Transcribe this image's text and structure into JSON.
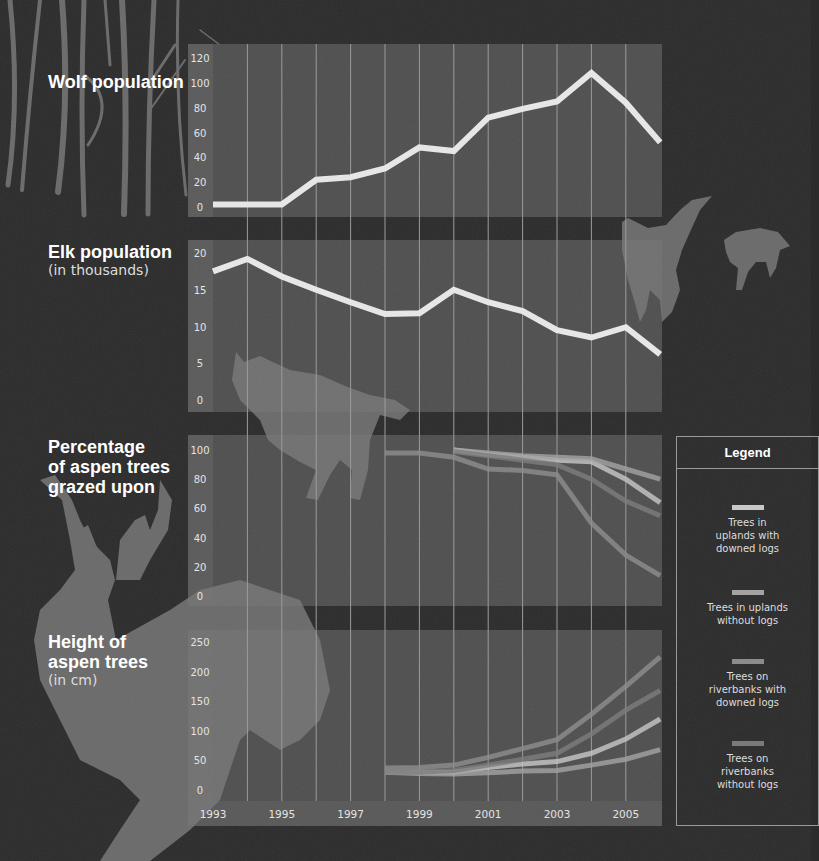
{
  "titles": {
    "wolf": "Wolf population",
    "elk": "Elk population",
    "elk_sub": "(in thousands)",
    "grazed_line1": "Percentage",
    "grazed_line2": "of aspen trees",
    "grazed_line3": "grazed upon",
    "height_line1": "Height of",
    "height_line2": "aspen trees",
    "height_sub": "(in cm)"
  },
  "legend": {
    "title": "Legend",
    "items": [
      {
        "label": "Trees in uplands with downed logs",
        "color": "#c8c8c8"
      },
      {
        "label": "Trees in uplands without logs",
        "color": "#a3a3a3"
      },
      {
        "label": "Trees on riverbanks with downed logs",
        "color": "#8c8c8c"
      },
      {
        "label": "Trees on riverbanks without logs",
        "color": "#7a7a7a"
      }
    ]
  },
  "x_ticks": [
    "1993",
    "1995",
    "1997",
    "1999",
    "2001",
    "2003",
    "2005"
  ],
  "chart_data": [
    {
      "type": "line",
      "title": "Wolf population",
      "x": [
        1993,
        1994,
        1995,
        1996,
        1997,
        1998,
        1999,
        2000,
        2001,
        2002,
        2003,
        2004,
        2005,
        2006
      ],
      "series": [
        {
          "name": "Wolves",
          "values": [
            2,
            2,
            2,
            22,
            24,
            31,
            48,
            45,
            72,
            79,
            85,
            108,
            84,
            52
          ]
        }
      ],
      "yticks": [
        0,
        20,
        40,
        60,
        80,
        100,
        120
      ],
      "ylim": [
        0,
        125
      ],
      "grid": "vertical"
    },
    {
      "type": "line",
      "title": "Elk population",
      "ylabel": "(in thousands)",
      "x": [
        1993,
        1994,
        1995,
        1996,
        1997,
        1998,
        1999,
        2000,
        2001,
        2002,
        2003,
        2004,
        2005,
        2006
      ],
      "series": [
        {
          "name": "Elk",
          "values": [
            17.5,
            19.2,
            16.8,
            15,
            13.3,
            11.7,
            11.8,
            15,
            13.3,
            12.1,
            9.5,
            8.5,
            9.9,
            6.2
          ]
        }
      ],
      "yticks": [
        0,
        5,
        10,
        15,
        20
      ],
      "ylim": [
        0,
        21
      ],
      "grid": "vertical"
    },
    {
      "type": "line",
      "title": "Percentage of aspen trees grazed upon",
      "x": [
        1998,
        1999,
        2000,
        2001,
        2002,
        2003,
        2004,
        2005,
        2006
      ],
      "series": [
        {
          "name": "Trees in uplands with downed logs",
          "values": [
            null,
            null,
            100,
            97,
            95,
            93,
            92,
            80,
            64
          ]
        },
        {
          "name": "Trees in uplands without logs",
          "values": [
            null,
            null,
            100,
            98,
            96,
            95,
            94,
            87,
            80
          ]
        },
        {
          "name": "Trees on riverbanks with downed logs",
          "values": [
            98,
            98,
            95,
            87,
            86,
            83,
            50,
            28,
            14
          ]
        },
        {
          "name": "Trees on riverbanks without logs",
          "values": [
            null,
            null,
            99,
            96,
            93,
            90,
            80,
            65,
            55
          ]
        }
      ],
      "yticks": [
        0,
        20,
        40,
        60,
        80,
        100
      ],
      "ylim": [
        0,
        105
      ],
      "grid": "vertical"
    },
    {
      "type": "line",
      "title": "Height of aspen trees",
      "ylabel": "(in cm)",
      "x": [
        1998,
        1999,
        2000,
        2001,
        2002,
        2003,
        2004,
        2005,
        2006
      ],
      "series": [
        {
          "name": "Trees in uplands with downed logs",
          "values": [
            30,
            30,
            30,
            38,
            44,
            48,
            62,
            86,
            120
          ]
        },
        {
          "name": "Trees in uplands without logs",
          "values": [
            30,
            28,
            27,
            29,
            32,
            33,
            42,
            52,
            68
          ]
        },
        {
          "name": "Trees on riverbanks with downed logs",
          "values": [
            37,
            38,
            42,
            55,
            70,
            85,
            128,
            175,
            225
          ]
        },
        {
          "name": "Trees on riverbanks without logs",
          "values": [
            30,
            30,
            33,
            42,
            52,
            62,
            95,
            135,
            168
          ]
        }
      ],
      "yticks": [
        0,
        50,
        100,
        150,
        200,
        250
      ],
      "ylim": [
        0,
        260
      ],
      "xticks": [
        "1993",
        "1995",
        "1997",
        "1999",
        "2001",
        "2003",
        "2005"
      ],
      "grid": "vertical"
    }
  ]
}
